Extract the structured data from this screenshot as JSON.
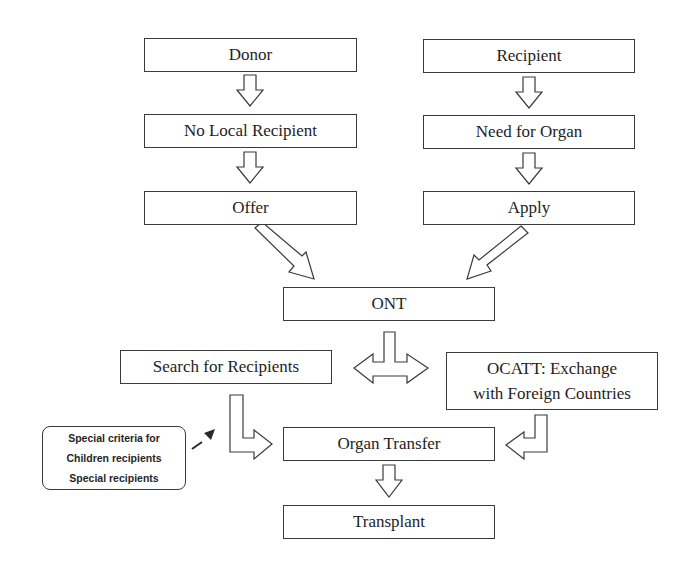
{
  "diagram": {
    "type": "flowchart",
    "nodes": {
      "donor": "Donor",
      "no_local_recipient": "No Local Recipient",
      "offer": "Offer",
      "recipient": "Recipient",
      "need_for_organ": "Need for Organ",
      "apply": "Apply",
      "ont": "ONT",
      "search_for_recipients": "Search for Recipients",
      "ocatt_line1": "OCATT: Exchange",
      "ocatt_line2": "with Foreign Countries",
      "organ_transfer": "Organ Transfer",
      "transplant": "Transplant"
    },
    "note": {
      "lines": [
        "Special criteria for",
        "Children recipients",
        "Special recipients"
      ]
    },
    "edges": [
      {
        "from": "Donor",
        "to": "No Local Recipient"
      },
      {
        "from": "No Local Recipient",
        "to": "Offer"
      },
      {
        "from": "Recipient",
        "to": "Need for Organ"
      },
      {
        "from": "Need for Organ",
        "to": "Apply"
      },
      {
        "from": "Offer",
        "to": "ONT"
      },
      {
        "from": "Apply",
        "to": "ONT"
      },
      {
        "from": "ONT",
        "to": "Search for Recipients"
      },
      {
        "from": "ONT",
        "to": "OCATT: Exchange with Foreign Countries"
      },
      {
        "from": "Search for Recipients",
        "to": "Organ Transfer"
      },
      {
        "from": "OCATT: Exchange with Foreign Countries",
        "to": "Organ Transfer"
      },
      {
        "from": "Special criteria note",
        "to": "Search for Recipients",
        "style": "dashed"
      },
      {
        "from": "Organ Transfer",
        "to": "Transplant"
      }
    ],
    "colors": {
      "stroke": "#3a3a3a",
      "text": "#1e1e1e",
      "background": "#ffffff"
    }
  }
}
